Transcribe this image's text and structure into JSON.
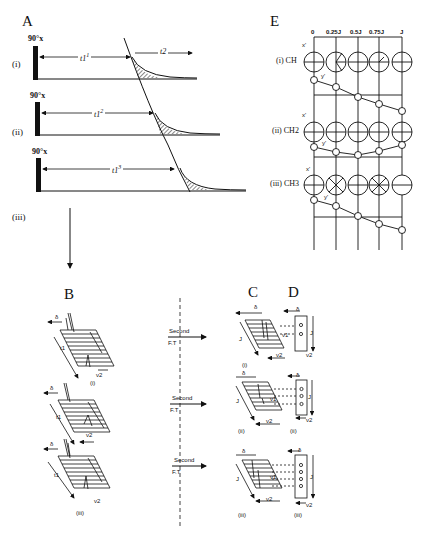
{
  "figure": {
    "panels": {
      "A": {
        "label": "A",
        "pulse_label": "90°x",
        "rows": [
          {
            "roman": "(i)",
            "delay": "t1",
            "delay_sup": "1",
            "acq": "t2"
          },
          {
            "roman": "(ii)",
            "delay": "t1",
            "delay_sup": "2",
            "acq": ""
          },
          {
            "roman": "(iii)",
            "delay": "t1",
            "delay_sup": "3",
            "acq": ""
          }
        ]
      },
      "B": {
        "label": "B",
        "delta": "δ",
        "t1": "t1",
        "nu2": "ν2",
        "rows": [
          {
            "roman": "(i)"
          },
          {
            "roman": "(ii)"
          },
          {
            "roman": "(iii)"
          }
        ]
      },
      "transform": {
        "line1": "Second",
        "line2": "F.T"
      },
      "C": {
        "label": "C",
        "delta": "δ",
        "J": "J",
        "nu1": "ν1",
        "nu2": "ν2",
        "rows": [
          {
            "roman": "(i)"
          },
          {
            "roman": "(ii)"
          },
          {
            "roman": "(iii)"
          }
        ]
      },
      "D": {
        "label": "D",
        "delta": "δ",
        "J": "J",
        "nu2": "ν2",
        "rows": [
          {
            "roman": "(i)",
            "peaks": 2
          },
          {
            "roman": "(ii)",
            "peaks": 3
          },
          {
            "roman": "(iii)",
            "peaks": 4
          }
        ]
      },
      "E": {
        "label": "E",
        "columns": [
          "0",
          "0.25J",
          "0.5J",
          "0.75J",
          "J"
        ],
        "axis_x": "x'",
        "axis_y": "y'",
        "rows": [
          {
            "label": "(i) CH"
          },
          {
            "label": "(ii) CH2"
          },
          {
            "label": "(iii) CH3"
          }
        ]
      }
    }
  }
}
